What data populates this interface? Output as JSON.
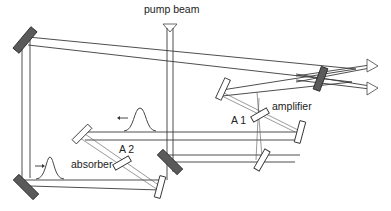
{
  "diagram": {
    "labels": {
      "pump": "pump beam",
      "amplifier": "amplifier",
      "a1": "A 1",
      "a2": "A 2",
      "absorber": "absorber"
    },
    "components": [
      {
        "name": "pump-input",
        "type": "pump arrow"
      },
      {
        "name": "flat-mirror-top-left",
        "type": "flat mirror"
      },
      {
        "name": "flat-mirror-bottom-left",
        "type": "flat mirror"
      },
      {
        "name": "flat-mirror-center",
        "type": "flat mirror"
      },
      {
        "name": "output-coupler",
        "type": "flat mirror"
      },
      {
        "name": "curved-mirror-amplifier-upper-left",
        "type": "curved mirror"
      },
      {
        "name": "curved-mirror-amplifier-right",
        "type": "curved mirror"
      },
      {
        "name": "curved-mirror-amplifier-bottom",
        "type": "curved mirror"
      },
      {
        "name": "curved-mirror-absorber-upper-left",
        "type": "curved mirror"
      },
      {
        "name": "curved-mirror-absorber-bottom-right",
        "type": "curved mirror"
      },
      {
        "name": "amplifier-jet",
        "type": "gain medium",
        "label": "A 1"
      },
      {
        "name": "absorber-jet",
        "type": "saturable absorber",
        "label": "A 2"
      }
    ],
    "pulses": [
      {
        "name": "pulse-left-moving",
        "direction": "left"
      },
      {
        "name": "pulse-right-moving",
        "direction": "right"
      }
    ],
    "outputs": 2
  }
}
